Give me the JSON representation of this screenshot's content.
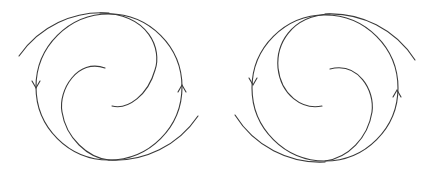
{
  "figure": {
    "background": "#ffffff",
    "stroke_color": "#3a3a3a",
    "panels": [
      {
        "name": "left-vortex",
        "rotation": "counterclockwise",
        "center": [
          109,
          88
        ],
        "radius": 73,
        "arrows": [
          {
            "position": [
              36,
              88
            ],
            "direction": "down"
          },
          {
            "position": [
              182,
              85
            ],
            "direction": "up"
          }
        ]
      },
      {
        "name": "right-vortex",
        "rotation": "counterclockwise-mirrored",
        "center": [
          325,
          90
        ],
        "radius": 72,
        "arrows": [
          {
            "position": [
              253,
              85
            ],
            "direction": "down"
          },
          {
            "position": [
              397,
              90
            ],
            "direction": "up"
          }
        ]
      }
    ]
  }
}
